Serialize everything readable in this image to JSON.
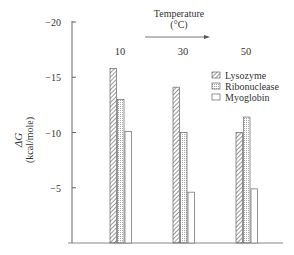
{
  "chart_data": {
    "type": "bar",
    "title": "",
    "annotation": {
      "line1": "Temperature",
      "line2": "(°C)"
    },
    "ylabel": {
      "line1": "ΔG",
      "line2": "(kcal/mole)"
    },
    "xlabel": "",
    "categories": [
      "10",
      "30",
      "50"
    ],
    "series": [
      {
        "name": "Lysozyme",
        "pattern": "diagonal-hatch",
        "values": [
          -15.8,
          -14.1,
          -10.0
        ]
      },
      {
        "name": "Ribonuclease",
        "pattern": "dotted",
        "values": [
          -13.0,
          -10.0,
          -11.4
        ]
      },
      {
        "name": "Myoglobin",
        "pattern": "open",
        "values": [
          -10.1,
          -4.6,
          -4.9
        ]
      }
    ],
    "ylim": [
      0,
      -20
    ],
    "yticks": [
      -20,
      -15,
      -10,
      -5
    ],
    "ytick_labels": [
      "−20",
      "−15",
      "−10",
      "−5"
    ],
    "grid": false,
    "legend_position": "upper-right"
  },
  "colors": {
    "axis": "#555555",
    "bar_stroke": "#666666"
  }
}
